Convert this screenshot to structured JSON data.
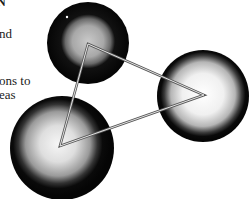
{
  "page_fragment": {
    "heading_fragment": "N",
    "text_lines": [
      "nd",
      "ons to",
      "eas"
    ]
  },
  "figure": {
    "spheres": [
      {
        "name": "top-sphere"
      },
      {
        "name": "right-sphere"
      },
      {
        "name": "bottom-left-sphere"
      }
    ],
    "colors": {
      "rim": "#0a0a0a",
      "core": "#f4f4f4",
      "mid": "#8a8a8a",
      "triangle_stroke": "#5a5a5a"
    }
  }
}
